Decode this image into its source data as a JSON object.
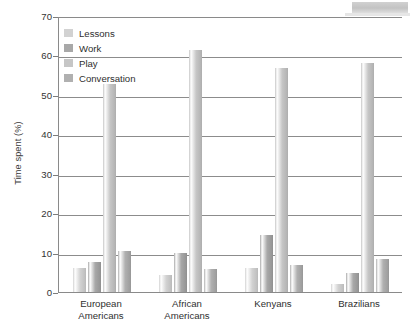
{
  "chart_data": {
    "type": "bar",
    "title": "",
    "xlabel": "",
    "ylabel": "Time spent (%)",
    "ylim": [
      0,
      70
    ],
    "yticks": [
      0,
      10,
      20,
      30,
      40,
      50,
      60,
      70
    ],
    "grid": true,
    "legend_position": "top-left",
    "categories": [
      "European Americans",
      "African Americans",
      "Kenyans",
      "Brazilians"
    ],
    "category_lines": [
      [
        "European",
        "Americans"
      ],
      [
        "African",
        "Americans"
      ],
      [
        "Kenyans",
        ""
      ],
      [
        "Brazilians",
        ""
      ]
    ],
    "series": [
      {
        "name": "Lessons",
        "color": "#d2d2d2",
        "values": [
          6.2,
          4.3,
          6.0,
          2.0
        ]
      },
      {
        "name": "Work",
        "color": "#a8a8a8",
        "values": [
          7.5,
          9.8,
          14.5,
          4.8
        ]
      },
      {
        "name": "Play",
        "color": "#c6c6c6",
        "values": [
          52.8,
          61.5,
          56.8,
          58.0
        ]
      },
      {
        "name": "Conversation",
        "color": "#b0b0b0",
        "values": [
          10.5,
          5.8,
          6.8,
          8.5
        ]
      }
    ]
  },
  "legend": {
    "items": [
      {
        "label": "Lessons"
      },
      {
        "label": "Work"
      },
      {
        "label": "Play"
      },
      {
        "label": "Conversation"
      }
    ]
  },
  "axes": {
    "y_title": "Time spent (%)",
    "y_ticks": [
      "70",
      "60",
      "50",
      "40",
      "30",
      "20",
      "10",
      "0"
    ]
  }
}
